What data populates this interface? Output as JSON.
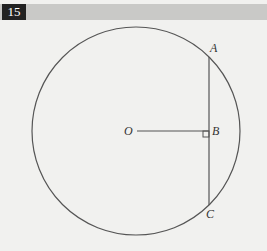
{
  "header": {
    "problem_number": "15"
  },
  "diagram": {
    "circle": {
      "cx": 136,
      "cy": 131,
      "r": 104
    },
    "points": {
      "O": {
        "label": "O",
        "x": 136,
        "y": 131
      },
      "A": {
        "label": "A",
        "x": 209,
        "y": 57
      },
      "B": {
        "label": "B",
        "x": 209,
        "y": 131
      },
      "C": {
        "label": "C",
        "x": 209,
        "y": 205
      }
    },
    "segments": [
      "OB",
      "AC"
    ],
    "right_angle_at": "B",
    "stroke_color": "#555555"
  }
}
